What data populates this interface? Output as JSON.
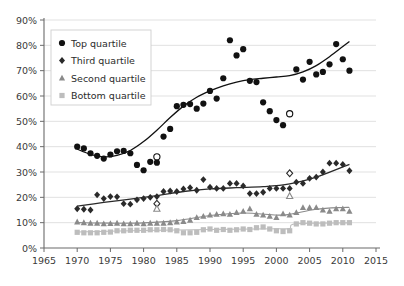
{
  "chart_data": {
    "type": "scatter",
    "title": "",
    "subtitle": "",
    "xlabel": "",
    "ylabel": "",
    "xlim": [
      1965,
      2015
    ],
    "ylim": [
      0,
      90
    ],
    "xticks": [
      1965,
      1970,
      1975,
      1980,
      1985,
      1990,
      1995,
      2000,
      2005,
      2010,
      2015
    ],
    "xtick_labels": [
      "1965",
      "1970",
      "1975",
      "1980",
      "1985",
      "1990",
      "1995",
      "2000",
      "2005",
      "2010",
      "2015"
    ],
    "yticks": [
      0,
      10,
      20,
      30,
      40,
      50,
      60,
      70,
      80,
      90
    ],
    "ytick_labels": [
      "0%",
      "10%",
      "20%",
      "30%",
      "40%",
      "50%",
      "60%",
      "70%",
      "80%",
      "90%"
    ],
    "grid": "horizontal",
    "legend_position": "top-left",
    "legend_entries": [
      "Top quartile",
      "Third quartile",
      "Second quartile",
      "Bottom quartile"
    ],
    "series": [
      {
        "name": "Top quartile",
        "marker": "circle",
        "color": "#111111",
        "trendline": true,
        "points": [
          {
            "x": 1970,
            "y": 40.0
          },
          {
            "x": 1971,
            "y": 39.3
          },
          {
            "x": 1972,
            "y": 37.4
          },
          {
            "x": 1973,
            "y": 36.4
          },
          {
            "x": 1974,
            "y": 35.3
          },
          {
            "x": 1975,
            "y": 36.9
          },
          {
            "x": 1976,
            "y": 38.2
          },
          {
            "x": 1977,
            "y": 38.3
          },
          {
            "x": 1978,
            "y": 37.4
          },
          {
            "x": 1979,
            "y": 32.8
          },
          {
            "x": 1980,
            "y": 30.7
          },
          {
            "x": 1981,
            "y": 34.0
          },
          {
            "x": 1982,
            "y": 33.7
          },
          {
            "x": 1983,
            "y": 44.0
          },
          {
            "x": 1984,
            "y": 47.0
          },
          {
            "x": 1985,
            "y": 56.0
          },
          {
            "x": 1986,
            "y": 56.5
          },
          {
            "x": 1987,
            "y": 56.8
          },
          {
            "x": 1988,
            "y": 55.0
          },
          {
            "x": 1989,
            "y": 57.0
          },
          {
            "x": 1990,
            "y": 62.0
          },
          {
            "x": 1991,
            "y": 59.0
          },
          {
            "x": 1992,
            "y": 67.0
          },
          {
            "x": 1993,
            "y": 82.0
          },
          {
            "x": 1994,
            "y": 76.0
          },
          {
            "x": 1995,
            "y": 78.5
          },
          {
            "x": 1996,
            "y": 66.0
          },
          {
            "x": 1997,
            "y": 65.5
          },
          {
            "x": 1998,
            "y": 57.5
          },
          {
            "x": 1999,
            "y": 54.0
          },
          {
            "x": 2000,
            "y": 50.5
          },
          {
            "x": 2001,
            "y": 48.5
          },
          {
            "x": 2002,
            "y": 53.0
          },
          {
            "x": 2003,
            "y": 70.5
          },
          {
            "x": 2004,
            "y": 66.5
          },
          {
            "x": 2005,
            "y": 73.5
          },
          {
            "x": 2006,
            "y": 68.5
          },
          {
            "x": 2007,
            "y": 69.5
          },
          {
            "x": 2008,
            "y": 72.5
          },
          {
            "x": 2009,
            "y": 80.5
          },
          {
            "x": 2010,
            "y": 74.5
          },
          {
            "x": 2011,
            "y": 70.0
          }
        ],
        "hollow_points": [
          {
            "x": 1982,
            "y": 36.0
          },
          {
            "x": 2002,
            "y": 53.0
          }
        ],
        "trend": [
          {
            "x": 1970,
            "y": 39.0
          },
          {
            "x": 1972,
            "y": 37.0
          },
          {
            "x": 1974,
            "y": 36.0
          },
          {
            "x": 1976,
            "y": 36.6
          },
          {
            "x": 1978,
            "y": 38.5
          },
          {
            "x": 1980,
            "y": 42.0
          },
          {
            "x": 1982,
            "y": 46.5
          },
          {
            "x": 1984,
            "y": 51.5
          },
          {
            "x": 1986,
            "y": 56.0
          },
          {
            "x": 1988,
            "y": 59.5
          },
          {
            "x": 1990,
            "y": 62.0
          },
          {
            "x": 1992,
            "y": 64.0
          },
          {
            "x": 1994,
            "y": 65.5
          },
          {
            "x": 1996,
            "y": 66.5
          },
          {
            "x": 1998,
            "y": 67.0
          },
          {
            "x": 2000,
            "y": 67.5
          },
          {
            "x": 2002,
            "y": 68.0
          },
          {
            "x": 2004,
            "y": 69.5
          },
          {
            "x": 2006,
            "y": 72.0
          },
          {
            "x": 2008,
            "y": 75.5
          },
          {
            "x": 2010,
            "y": 79.5
          },
          {
            "x": 2011,
            "y": 81.5
          }
        ]
      },
      {
        "name": "Third quartile",
        "marker": "diamond",
        "color": "#2a2a2a",
        "trendline": true,
        "points": [
          {
            "x": 1970,
            "y": 15.5
          },
          {
            "x": 1971,
            "y": 15.3
          },
          {
            "x": 1972,
            "y": 15.0
          },
          {
            "x": 1973,
            "y": 21.0
          },
          {
            "x": 1974,
            "y": 19.5
          },
          {
            "x": 1975,
            "y": 20.3
          },
          {
            "x": 1976,
            "y": 20.2
          },
          {
            "x": 1977,
            "y": 17.5
          },
          {
            "x": 1978,
            "y": 17.3
          },
          {
            "x": 1979,
            "y": 19.0
          },
          {
            "x": 1980,
            "y": 19.5
          },
          {
            "x": 1981,
            "y": 20.0
          },
          {
            "x": 1982,
            "y": 20.3
          },
          {
            "x": 1983,
            "y": 22.3
          },
          {
            "x": 1984,
            "y": 22.5
          },
          {
            "x": 1985,
            "y": 22.3
          },
          {
            "x": 1986,
            "y": 23.3
          },
          {
            "x": 1987,
            "y": 23.8
          },
          {
            "x": 1988,
            "y": 22.8
          },
          {
            "x": 1989,
            "y": 27.0
          },
          {
            "x": 1990,
            "y": 24.0
          },
          {
            "x": 1991,
            "y": 23.5
          },
          {
            "x": 1992,
            "y": 23.5
          },
          {
            "x": 1993,
            "y": 25.5
          },
          {
            "x": 1994,
            "y": 25.5
          },
          {
            "x": 1995,
            "y": 24.5
          },
          {
            "x": 1996,
            "y": 21.5
          },
          {
            "x": 1997,
            "y": 21.5
          },
          {
            "x": 1998,
            "y": 22.0
          },
          {
            "x": 1999,
            "y": 23.5
          },
          {
            "x": 2000,
            "y": 23.5
          },
          {
            "x": 2001,
            "y": 23.5
          },
          {
            "x": 2002,
            "y": 23.5
          },
          {
            "x": 2003,
            "y": 26.0
          },
          {
            "x": 2004,
            "y": 25.5
          },
          {
            "x": 2005,
            "y": 27.5
          },
          {
            "x": 2006,
            "y": 28.0
          },
          {
            "x": 2007,
            "y": 30.0
          },
          {
            "x": 2008,
            "y": 33.5
          },
          {
            "x": 2009,
            "y": 33.5
          },
          {
            "x": 2010,
            "y": 33.0
          },
          {
            "x": 2011,
            "y": 30.5
          }
        ],
        "hollow_points": [
          {
            "x": 1982,
            "y": 17.5
          },
          {
            "x": 2002,
            "y": 29.5
          }
        ],
        "trend": [
          {
            "x": 1970,
            "y": 16.5
          },
          {
            "x": 1974,
            "y": 18.0
          },
          {
            "x": 1978,
            "y": 19.3
          },
          {
            "x": 1982,
            "y": 20.7
          },
          {
            "x": 1986,
            "y": 22.3
          },
          {
            "x": 1990,
            "y": 23.3
          },
          {
            "x": 1994,
            "y": 23.8
          },
          {
            "x": 1998,
            "y": 24.2
          },
          {
            "x": 2002,
            "y": 25.3
          },
          {
            "x": 2006,
            "y": 28.0
          },
          {
            "x": 2010,
            "y": 32.0
          },
          {
            "x": 2011,
            "y": 33.0
          }
        ]
      },
      {
        "name": "Second quartile",
        "marker": "triangle",
        "color": "#8a8a8a",
        "trendline": true,
        "points": [
          {
            "x": 1970,
            "y": 10.3
          },
          {
            "x": 1971,
            "y": 10.0
          },
          {
            "x": 1972,
            "y": 9.8
          },
          {
            "x": 1973,
            "y": 9.8
          },
          {
            "x": 1974,
            "y": 9.6
          },
          {
            "x": 1975,
            "y": 9.7
          },
          {
            "x": 1976,
            "y": 9.8
          },
          {
            "x": 1977,
            "y": 9.6
          },
          {
            "x": 1978,
            "y": 9.6
          },
          {
            "x": 1979,
            "y": 9.8
          },
          {
            "x": 1980,
            "y": 9.6
          },
          {
            "x": 1981,
            "y": 9.8
          },
          {
            "x": 1982,
            "y": 9.8
          },
          {
            "x": 1983,
            "y": 9.8
          },
          {
            "x": 1984,
            "y": 10.0
          },
          {
            "x": 1985,
            "y": 10.3
          },
          {
            "x": 1986,
            "y": 10.5
          },
          {
            "x": 1987,
            "y": 11.0
          },
          {
            "x": 1988,
            "y": 12.0
          },
          {
            "x": 1989,
            "y": 12.5
          },
          {
            "x": 1990,
            "y": 13.0
          },
          {
            "x": 1991,
            "y": 13.3
          },
          {
            "x": 1992,
            "y": 13.5
          },
          {
            "x": 1993,
            "y": 13.3
          },
          {
            "x": 1994,
            "y": 14.0
          },
          {
            "x": 1995,
            "y": 14.5
          },
          {
            "x": 1996,
            "y": 15.5
          },
          {
            "x": 1997,
            "y": 13.3
          },
          {
            "x": 1998,
            "y": 13.0
          },
          {
            "x": 1999,
            "y": 12.5
          },
          {
            "x": 2000,
            "y": 12.0
          },
          {
            "x": 2001,
            "y": 13.5
          },
          {
            "x": 2002,
            "y": 13.0
          },
          {
            "x": 2003,
            "y": 14.0
          },
          {
            "x": 2004,
            "y": 16.0
          },
          {
            "x": 2005,
            "y": 16.0
          },
          {
            "x": 2006,
            "y": 16.0
          },
          {
            "x": 2007,
            "y": 15.0
          },
          {
            "x": 2008,
            "y": 14.5
          },
          {
            "x": 2009,
            "y": 15.5
          },
          {
            "x": 2010,
            "y": 15.5
          },
          {
            "x": 2011,
            "y": 14.5
          }
        ],
        "hollow_points": [
          {
            "x": 1982,
            "y": 15.5
          },
          {
            "x": 2002,
            "y": 20.5
          }
        ],
        "trend": [
          {
            "x": 1970,
            "y": 10.0
          },
          {
            "x": 1975,
            "y": 9.8
          },
          {
            "x": 1980,
            "y": 9.9
          },
          {
            "x": 1985,
            "y": 10.8
          },
          {
            "x": 1990,
            "y": 12.8
          },
          {
            "x": 1995,
            "y": 13.8
          },
          {
            "x": 2000,
            "y": 13.0
          },
          {
            "x": 2002,
            "y": 13.3
          },
          {
            "x": 2006,
            "y": 15.3
          },
          {
            "x": 2010,
            "y": 16.0
          },
          {
            "x": 2011,
            "y": 16.0
          }
        ]
      },
      {
        "name": "Bottom quartile",
        "marker": "square",
        "color": "#bdbdbd",
        "trendline": true,
        "points": [
          {
            "x": 1970,
            "y": 6.2
          },
          {
            "x": 1971,
            "y": 6.0
          },
          {
            "x": 1972,
            "y": 6.0
          },
          {
            "x": 1973,
            "y": 6.0
          },
          {
            "x": 1974,
            "y": 6.2
          },
          {
            "x": 1975,
            "y": 6.3
          },
          {
            "x": 1976,
            "y": 6.8
          },
          {
            "x": 1977,
            "y": 6.8
          },
          {
            "x": 1978,
            "y": 7.0
          },
          {
            "x": 1979,
            "y": 7.0
          },
          {
            "x": 1980,
            "y": 7.0
          },
          {
            "x": 1981,
            "y": 7.2
          },
          {
            "x": 1982,
            "y": 7.2
          },
          {
            "x": 1983,
            "y": 7.3
          },
          {
            "x": 1984,
            "y": 7.2
          },
          {
            "x": 1985,
            "y": 6.8
          },
          {
            "x": 1986,
            "y": 6.0
          },
          {
            "x": 1987,
            "y": 6.0
          },
          {
            "x": 1988,
            "y": 6.2
          },
          {
            "x": 1989,
            "y": 7.2
          },
          {
            "x": 1990,
            "y": 7.5
          },
          {
            "x": 1991,
            "y": 7.0
          },
          {
            "x": 1992,
            "y": 7.3
          },
          {
            "x": 1993,
            "y": 7.0
          },
          {
            "x": 1994,
            "y": 7.2
          },
          {
            "x": 1995,
            "y": 7.5
          },
          {
            "x": 1996,
            "y": 7.3
          },
          {
            "x": 1997,
            "y": 8.0
          },
          {
            "x": 1998,
            "y": 8.3
          },
          {
            "x": 1999,
            "y": 7.5
          },
          {
            "x": 2000,
            "y": 6.8
          },
          {
            "x": 2001,
            "y": 6.5
          },
          {
            "x": 2002,
            "y": 6.8
          },
          {
            "x": 2003,
            "y": 9.5
          },
          {
            "x": 2004,
            "y": 10.0
          },
          {
            "x": 2005,
            "y": 9.8
          },
          {
            "x": 2006,
            "y": 9.5
          },
          {
            "x": 2007,
            "y": 9.5
          },
          {
            "x": 2008,
            "y": 9.8
          },
          {
            "x": 2009,
            "y": 10.0
          },
          {
            "x": 2010,
            "y": 10.0
          },
          {
            "x": 2011,
            "y": 10.0
          }
        ],
        "hollow_points": [],
        "trend": [
          {
            "x": 1970,
            "y": 6.3
          },
          {
            "x": 1980,
            "y": 6.9
          },
          {
            "x": 1990,
            "y": 7.3
          },
          {
            "x": 2000,
            "y": 7.6
          },
          {
            "x": 2002,
            "y": 7.7
          },
          {
            "x": 2003,
            "y": 9.6
          },
          {
            "x": 2011,
            "y": 9.9
          }
        ]
      }
    ]
  }
}
